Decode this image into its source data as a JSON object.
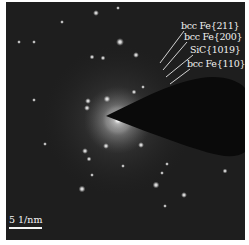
{
  "figure": {
    "type": "selected-area electron diffraction pattern",
    "labels": [
      {
        "text": "bcc Fe{211}",
        "x": 181,
        "y": 26
      },
      {
        "text": "bcc Fe{200}",
        "x": 184,
        "y": 37
      },
      {
        "text": "SiC{1019}",
        "x": 190,
        "y": 50
      },
      {
        "text": "bcc Fe{110}",
        "x": 187,
        "y": 64
      }
    ],
    "scale_bar": {
      "label": "5 1/nm"
    },
    "colors": {
      "background": "#1c1c1c",
      "spots": "#ffffff",
      "text": "#f2f2f2"
    }
  }
}
